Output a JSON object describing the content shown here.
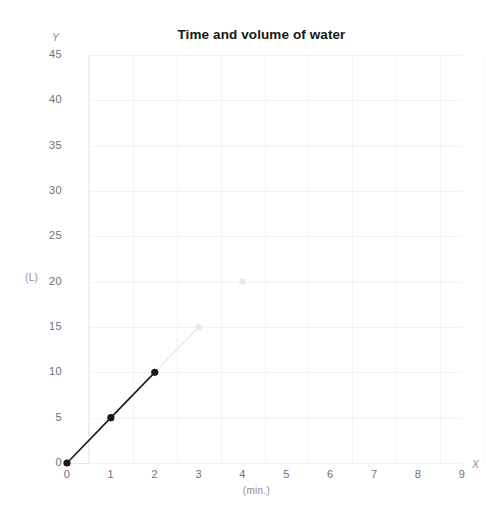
{
  "chart_data": {
    "type": "line",
    "title": "Time and volume of water",
    "xlabel": "(min.)",
    "ylabel": "(L)",
    "x_axis_name": "X",
    "y_axis_name": "Y",
    "xlim": [
      0,
      9
    ],
    "ylim": [
      0,
      45
    ],
    "grid": true,
    "legend": "none",
    "xticks": [
      "0",
      "1",
      "2",
      "3",
      "4",
      "5",
      "6",
      "7",
      "8",
      "9"
    ],
    "yticks": [
      "0",
      "5",
      "10",
      "15",
      "20",
      "25",
      "30",
      "35",
      "40",
      "45"
    ],
    "series": [
      {
        "name": "measured",
        "style": "solid-dark",
        "color": "#1a1a1a",
        "points": [
          {
            "x": 0,
            "y": 0
          },
          {
            "x": 1,
            "y": 5
          },
          {
            "x": 2,
            "y": 10
          }
        ]
      },
      {
        "name": "faint-extension",
        "style": "faint-gray",
        "color": "#e8e8ea",
        "points": [
          {
            "x": 3,
            "y": 15
          },
          {
            "x": 4,
            "y": 20
          }
        ]
      }
    ]
  },
  "title": {
    "text": "Time and volume of water"
  },
  "axes": {
    "y_name": "Y",
    "x_name": "X",
    "y_unit": "(L)",
    "x_unit": "(min.)"
  },
  "yticks": [
    {
      "label": "45",
      "value": 45
    },
    {
      "label": "40",
      "value": 40
    },
    {
      "label": "35",
      "value": 35
    },
    {
      "label": "30",
      "value": 30
    },
    {
      "label": "25",
      "value": 25
    },
    {
      "label": "20",
      "value": 20
    },
    {
      "label": "15",
      "value": 15
    },
    {
      "label": "10",
      "value": 10
    },
    {
      "label": "5",
      "value": 5
    },
    {
      "label": "0",
      "value": 0
    }
  ],
  "xticks": [
    {
      "label": "0",
      "value": 0
    },
    {
      "label": "1",
      "value": 1
    },
    {
      "label": "2",
      "value": 2
    },
    {
      "label": "3",
      "value": 3
    },
    {
      "label": "4",
      "value": 4
    },
    {
      "label": "5",
      "value": 5
    },
    {
      "label": "6",
      "value": 6
    },
    {
      "label": "7",
      "value": 7
    },
    {
      "label": "8",
      "value": 8
    },
    {
      "label": "9",
      "value": 9
    }
  ],
  "colors": {
    "line_dark": "#1a1a1a",
    "line_faint": "#e6e6e9",
    "grid": "#f2f2f4",
    "tick_text": "#6f6f74",
    "title_text": "#161616"
  }
}
